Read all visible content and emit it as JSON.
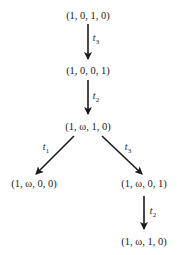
{
  "diagram": {
    "type": "coverability-tree",
    "nodes": [
      {
        "id": "n0",
        "label": "(1, 0, 1, 0)",
        "x": 88,
        "y": 15
      },
      {
        "id": "n1",
        "label": "(1, 0, 0, 1)",
        "x": 88,
        "y": 70
      },
      {
        "id": "n2",
        "label": "(1, ω, 1, 0)",
        "x": 88,
        "y": 126
      },
      {
        "id": "n3",
        "label": "(1, ω, 0, 0)",
        "x": 34,
        "y": 183
      },
      {
        "id": "n4",
        "label": "(1, ω, 0, 1)",
        "x": 144,
        "y": 183
      },
      {
        "id": "n5",
        "label": "(1, ω, 1, 0)",
        "x": 144,
        "y": 241
      }
    ],
    "edges": [
      {
        "from": "n0",
        "to": "n1",
        "base": "t",
        "sub": "3",
        "lx": 96,
        "ly": 39
      },
      {
        "from": "n1",
        "to": "n2",
        "base": "t",
        "sub": "2",
        "lx": 96,
        "ly": 97
      },
      {
        "from": "n2",
        "to": "n3",
        "base": "t",
        "sub": "1",
        "lx": 46,
        "ly": 148
      },
      {
        "from": "n2",
        "to": "n4",
        "base": "t",
        "sub": "3",
        "lx": 128,
        "ly": 148
      },
      {
        "from": "n4",
        "to": "n5",
        "base": "t",
        "sub": "2",
        "lx": 153,
        "ly": 212
      }
    ]
  }
}
